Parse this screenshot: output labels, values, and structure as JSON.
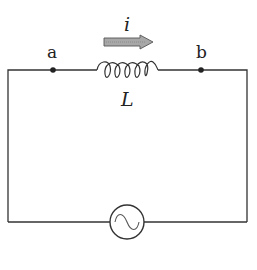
{
  "diagram": {
    "type": "circuit",
    "labels": {
      "current": "i",
      "inductor": "L",
      "node_a": "a",
      "node_b": "b"
    },
    "components": [
      {
        "id": "inductor",
        "symbol": "coil",
        "label": "L"
      },
      {
        "id": "ac_source",
        "symbol": "circle-with-sine"
      }
    ],
    "nodes": [
      {
        "id": "a",
        "label": "a"
      },
      {
        "id": "b",
        "label": "b"
      }
    ],
    "current_arrow": {
      "label": "i",
      "direction": "left-to-right",
      "fill": "#a8a8a8"
    },
    "colors": {
      "wire": "#333333",
      "arrow_fill": "#a8a8a8",
      "arrow_stroke": "#555555",
      "background": "#ffffff"
    }
  }
}
